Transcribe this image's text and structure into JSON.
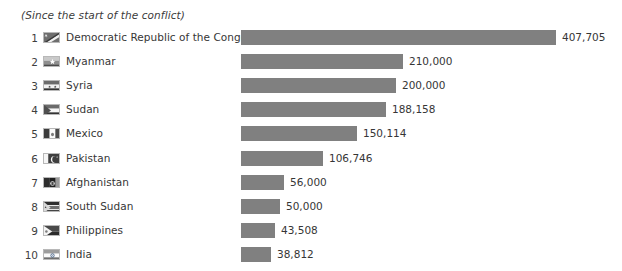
{
  "chart_data": {
    "type": "bar",
    "orientation": "horizontal",
    "title": "",
    "subtitle": "(Since the start of the conflict)",
    "xlabel": "",
    "ylabel": "",
    "grid": false,
    "legend": null,
    "axis_visible": false,
    "value_labels_shown": true,
    "xlim": [
      0,
      407705
    ],
    "categories": [
      "Democratic Republic of the Congo",
      "Myanmar",
      "Syria",
      "Sudan",
      "Mexico",
      "Pakistan",
      "Afghanistan",
      "South Sudan",
      "Philippines",
      "India"
    ],
    "values": [
      407705,
      210000,
      200000,
      188158,
      150114,
      106746,
      56000,
      50000,
      43508,
      38812
    ],
    "value_labels": [
      "407,705",
      "210,000",
      "200,000",
      "188,158",
      "150,114",
      "106,746",
      "56,000",
      "50,000",
      "43,508",
      "38,812"
    ],
    "ranks": [
      "1",
      "2",
      "3",
      "4",
      "5",
      "6",
      "7",
      "8",
      "9",
      "10"
    ],
    "bar_color": "#808080",
    "background_color": "#ffffff",
    "text_color": "#363636"
  },
  "rows": [
    {
      "rank": "1",
      "country": "Democratic Republic of the Congo",
      "value_label": "407,705",
      "value": 407705,
      "flag_icon": "flag-democratic-republic-of-the-congo-icon"
    },
    {
      "rank": "2",
      "country": "Myanmar",
      "value_label": "210,000",
      "value": 210000,
      "flag_icon": "flag-myanmar-icon"
    },
    {
      "rank": "3",
      "country": "Syria",
      "value_label": "200,000",
      "value": 200000,
      "flag_icon": "flag-syria-icon"
    },
    {
      "rank": "4",
      "country": "Sudan",
      "value_label": "188,158",
      "value": 188158,
      "flag_icon": "flag-sudan-icon"
    },
    {
      "rank": "5",
      "country": "Mexico",
      "value_label": "150,114",
      "value": 150114,
      "flag_icon": "flag-mexico-icon"
    },
    {
      "rank": "6",
      "country": "Pakistan",
      "value_label": "106,746",
      "value": 106746,
      "flag_icon": "flag-pakistan-icon"
    },
    {
      "rank": "7",
      "country": "Afghanistan",
      "value_label": "56,000",
      "value": 56000,
      "flag_icon": "flag-afghanistan-icon"
    },
    {
      "rank": "8",
      "country": "South Sudan",
      "value_label": "50,000",
      "value": 50000,
      "flag_icon": "flag-south-sudan-icon"
    },
    {
      "rank": "9",
      "country": "Philippines",
      "value_label": "43,508",
      "value": 43508,
      "flag_icon": "flag-philippines-icon"
    },
    {
      "rank": "10",
      "country": "India",
      "value_label": "38,812",
      "value": 38812,
      "flag_icon": "flag-india-icon"
    }
  ]
}
